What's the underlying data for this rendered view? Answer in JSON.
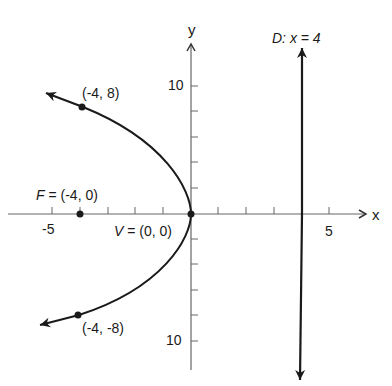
{
  "diagram": {
    "type": "parabola",
    "equation_implied": "y^2 = -16x",
    "axes": {
      "x_label": "x",
      "y_label": "y",
      "x_tick_labels": [
        {
          "value": -5,
          "text": "-5"
        },
        {
          "value": 5,
          "text": "5"
        }
      ],
      "y_tick_labels": [
        {
          "value": 10,
          "text": "10"
        },
        {
          "value": -10,
          "text": "10"
        }
      ],
      "x_ticks": [
        -5,
        -4,
        -3,
        -2,
        -1,
        1,
        2,
        3,
        4,
        5
      ],
      "y_ticks": [
        -10,
        -8,
        -6,
        -4,
        -2,
        2,
        4,
        6,
        8,
        10
      ]
    },
    "directrix": {
      "label_prefix": "D:",
      "label_eq": "x = 4",
      "x": 4
    },
    "points": {
      "focus": {
        "label_prefix": "F",
        "label_eq": "= (-4, 0)",
        "x": -4,
        "y": 0
      },
      "vertex": {
        "label_prefix": "V",
        "label_eq": "= (0, 0)",
        "x": 0,
        "y": 0
      },
      "upper": {
        "label": "(-4, 8)",
        "x": -4,
        "y": 8
      },
      "lower": {
        "label": "(-4, -8)",
        "x": -4,
        "y": -8
      }
    },
    "colors": {
      "ink": "#1a1a1a",
      "axis": "#555555",
      "background": "#ffffff"
    }
  }
}
